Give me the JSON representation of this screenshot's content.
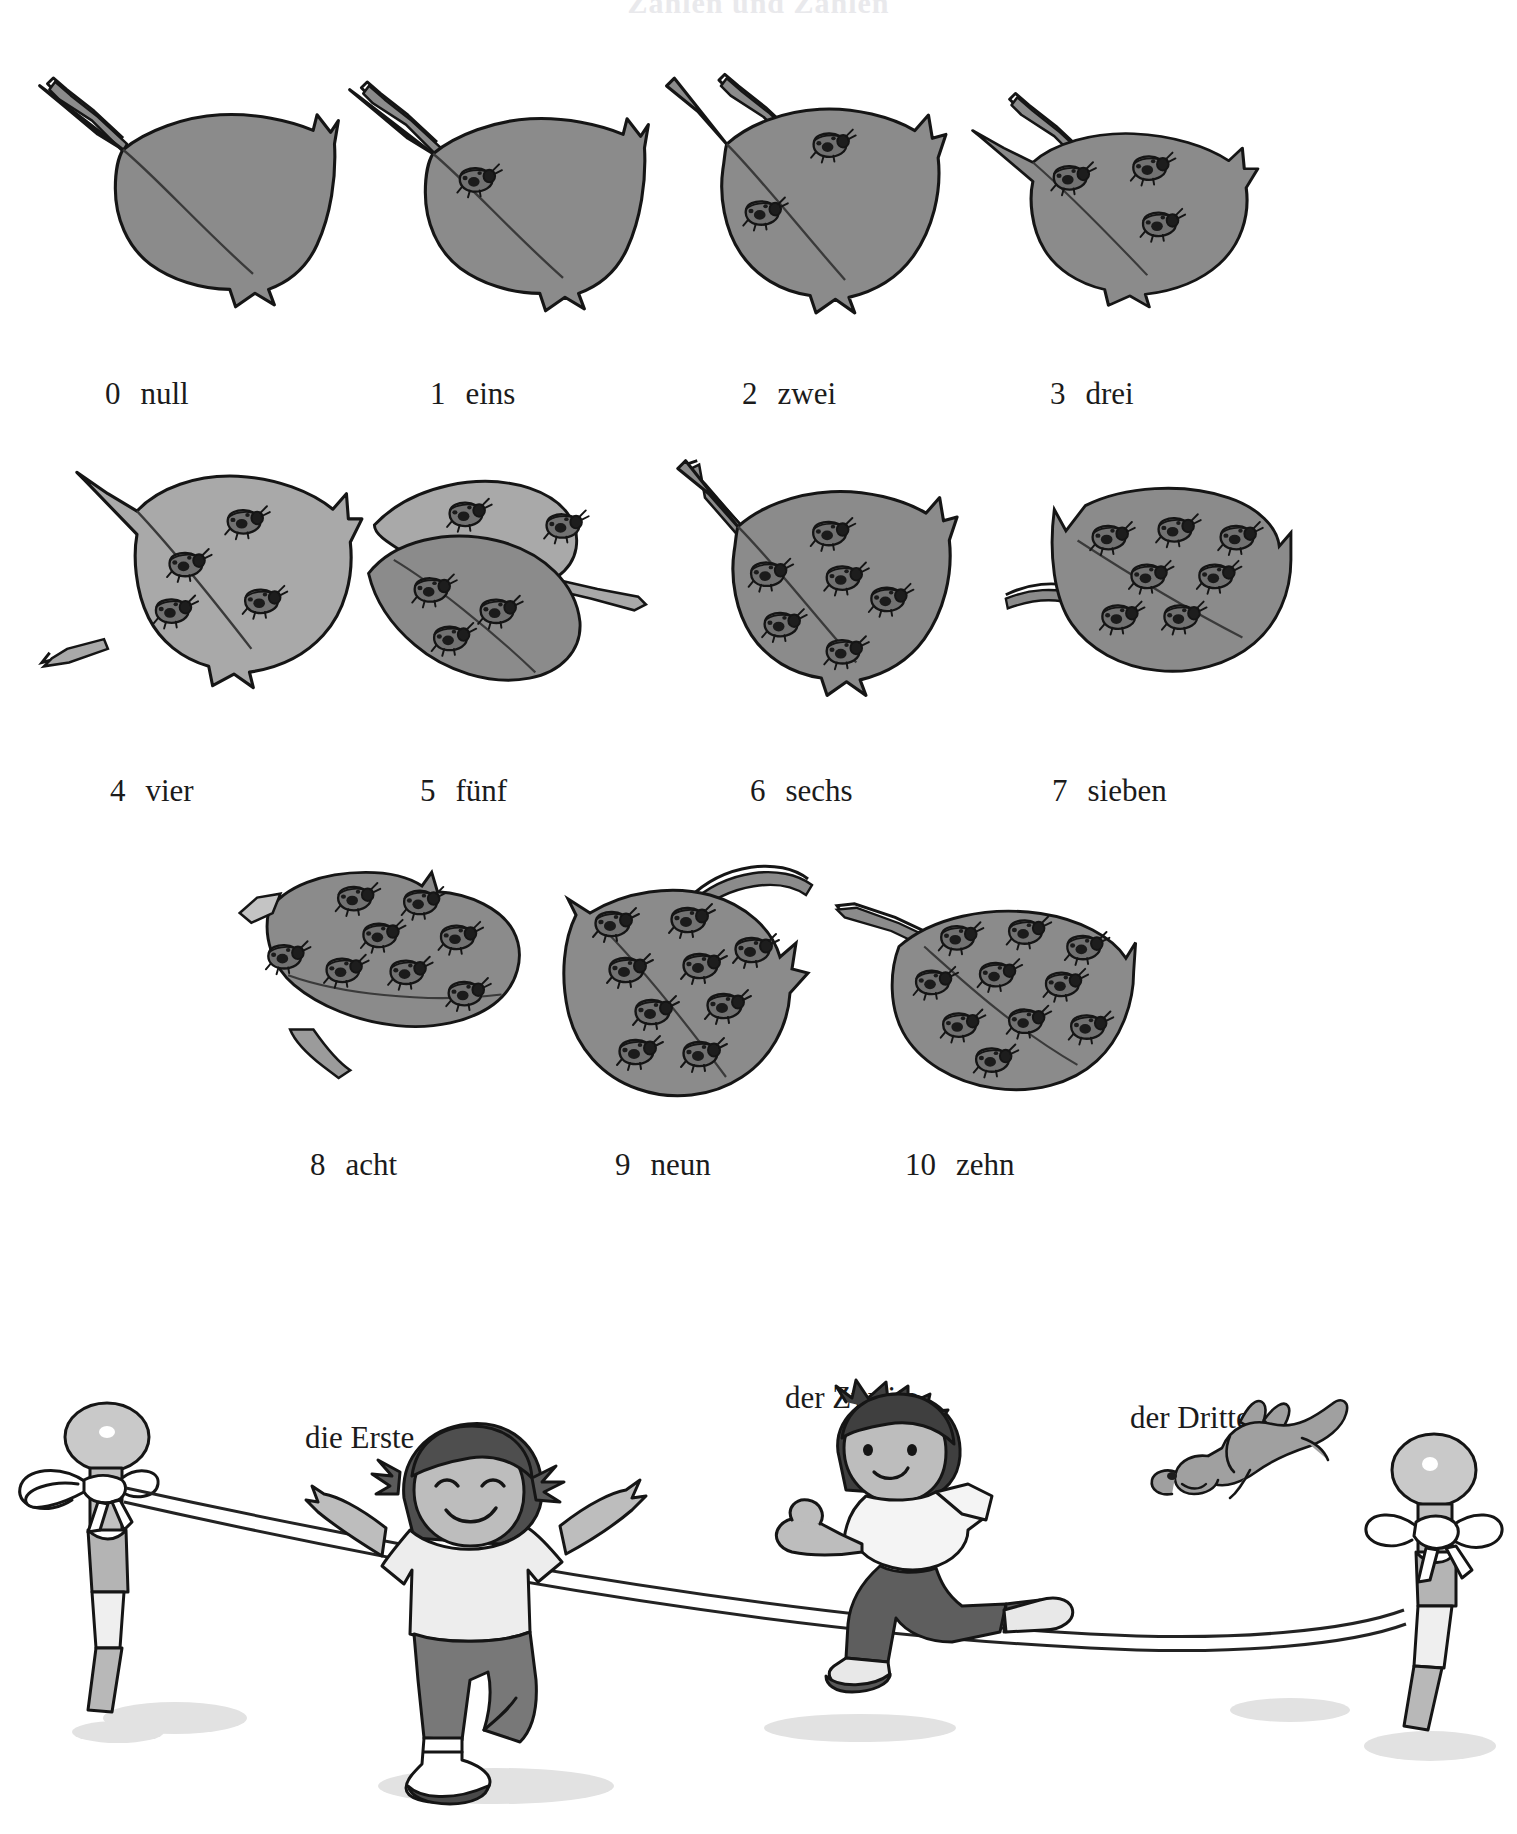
{
  "document": {
    "title": "Zahlen und Zählen",
    "language": "de"
  },
  "numbers_section": {
    "rows": [
      {
        "row_index": 1,
        "items": [
          {
            "numeral": "0",
            "word": "null",
            "ladybug_count": 0,
            "leaf_tone": "dark"
          },
          {
            "numeral": "1",
            "word": "eins",
            "ladybug_count": 1,
            "leaf_tone": "dark"
          },
          {
            "numeral": "2",
            "word": "zwei",
            "ladybug_count": 2,
            "leaf_tone": "dark"
          },
          {
            "numeral": "3",
            "word": "drei",
            "ladybug_count": 3,
            "leaf_tone": "dark"
          }
        ]
      },
      {
        "row_index": 2,
        "items": [
          {
            "numeral": "4",
            "word": "vier",
            "ladybug_count": 4,
            "leaf_tone": "light"
          },
          {
            "numeral": "5",
            "word": "fünf",
            "ladybug_count": 5,
            "leaf_tone": "light"
          },
          {
            "numeral": "6",
            "word": "sechs",
            "ladybug_count": 6,
            "leaf_tone": "dark"
          },
          {
            "numeral": "7",
            "word": "sieben",
            "ladybug_count": 7,
            "leaf_tone": "dark"
          }
        ]
      },
      {
        "row_index": 3,
        "items": [
          {
            "numeral": "8",
            "word": "acht",
            "ladybug_count": 8,
            "leaf_tone": "dark"
          },
          {
            "numeral": "9",
            "word": "neun",
            "ladybug_count": 9,
            "leaf_tone": "dark"
          },
          {
            "numeral": "10",
            "word": "zehn",
            "ladybug_count": 10,
            "leaf_tone": "dark"
          }
        ]
      }
    ]
  },
  "ordinals_section": {
    "labels": [
      {
        "text": "die Erste",
        "for": "girl-runner"
      },
      {
        "text": "der Zweite",
        "for": "boy-runner"
      },
      {
        "text": "der Dritte",
        "for": "dog-runner"
      }
    ],
    "scene": {
      "description": "finish line race",
      "left_post": "post-with-ribbon-left",
      "right_post": "post-with-ribbon-right",
      "tape": "finish-line-tape"
    }
  },
  "palette": {
    "leaf_dark": "#8b8b8b",
    "leaf_light": "#a9a9a9",
    "leaf_shadow": "#6f6f6f",
    "ink": "#151515",
    "ladybug_body": "#6a6a6a",
    "ladybug_spot": "#1d1d1d",
    "skin": "#bdbdbd",
    "hair": "#4a4a4a",
    "shirt_light": "#e9e9e9",
    "pants_dark": "#5e5e5e",
    "ground_shadow": "#dcdcdc",
    "paper": "#ffffff"
  }
}
